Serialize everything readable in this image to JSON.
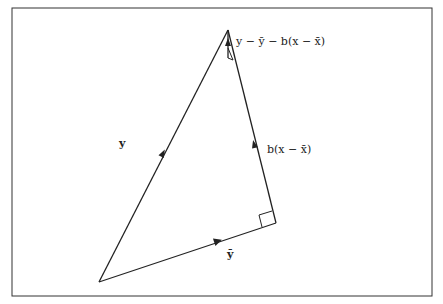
{
  "diagram": {
    "type": "vector-geometry",
    "labels": {
      "y": "y",
      "ybar": "ȳ",
      "fit": "b(x − x̄)",
      "residual": "y − ȳ − b(x − x̄)"
    },
    "colors": {
      "line": "#222222",
      "background": "#ffffff"
    }
  }
}
